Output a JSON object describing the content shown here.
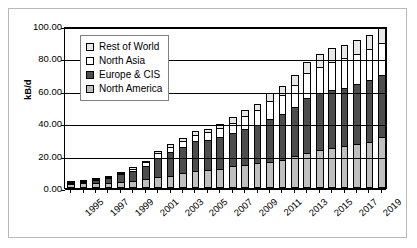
{
  "chart_data": {
    "type": "bar",
    "subtype": "stacked-column",
    "title": "",
    "xlabel": "",
    "ylabel": "kB/d",
    "ylim": [
      0,
      100
    ],
    "yticks": [
      "0.00",
      "20.00",
      "40.00",
      "60.00",
      "80.00",
      "100.00"
    ],
    "ytick_values": [
      0,
      20,
      40,
      60,
      80,
      100
    ],
    "grid": true,
    "legend_position": "upper-left-inside",
    "categories": [
      "1995",
      "1996",
      "1997",
      "1998",
      "1999",
      "2000",
      "2001",
      "2002",
      "2003",
      "2004",
      "2005",
      "2006",
      "2007",
      "2008",
      "2009",
      "2010",
      "2011",
      "2012",
      "2013",
      "2014",
      "2015",
      "2016",
      "2017",
      "2018",
      "2019",
      "2020"
    ],
    "xtick_labels": [
      "1995",
      "",
      "1997",
      "",
      "1999",
      "",
      "2001",
      "",
      "2003",
      "",
      "2005",
      "",
      "2007",
      "",
      "2009",
      "",
      "2011",
      "",
      "2013",
      "",
      "2015",
      "",
      "2017",
      "",
      "2019",
      ""
    ],
    "series": [
      {
        "name": "North America",
        "color": "#bfbfbf",
        "values": [
          2.6,
          2.8,
          3.0,
          3.4,
          3.8,
          4.4,
          5.4,
          6.5,
          7.6,
          9.2,
          10.4,
          11.4,
          12.0,
          13.4,
          14.4,
          15.2,
          16.2,
          17.2,
          20.0,
          21.8,
          23.2,
          24.6,
          26.0,
          27.4,
          28.4,
          31.4
        ]
      },
      {
        "name": "Europe & CIS",
        "color": "#4d4d4d",
        "values": [
          0.8,
          1.2,
          2.0,
          3.0,
          4.6,
          6.2,
          8.2,
          12.2,
          14.8,
          16.0,
          18.4,
          18.0,
          19.4,
          20.4,
          22.2,
          23.6,
          26.6,
          28.4,
          29.8,
          33.8,
          35.4,
          35.8,
          35.8,
          36.8,
          38.2,
          38.6
        ]
      },
      {
        "name": "North Asia",
        "color": "#ffffff",
        "values": [
          0.1,
          0.2,
          0.3,
          0.5,
          0.8,
          1.4,
          2.4,
          2.8,
          3.2,
          3.8,
          4.2,
          5.0,
          5.4,
          6.6,
          7.8,
          9.2,
          10.8,
          12.0,
          13.6,
          15.2,
          16.4,
          17.6,
          18.2,
          18.6,
          19.0,
          19.6
        ]
      },
      {
        "name": "Rest of World",
        "color": "#e8e8e8",
        "values": [
          0.1,
          0.2,
          0.3,
          0.4,
          0.6,
          0.8,
          1.0,
          1.2,
          1.4,
          1.6,
          2.0,
          2.2,
          2.6,
          3.2,
          3.6,
          4.0,
          4.8,
          5.4,
          6.4,
          7.2,
          8.0,
          8.4,
          8.6,
          8.8,
          9.0,
          9.4
        ]
      }
    ],
    "totals": [
      3.6,
      4.4,
      5.6,
      7.3,
      9.8,
      12.8,
      17.0,
      22.7,
      27.0,
      30.6,
      35.0,
      36.6,
      39.4,
      43.6,
      48.0,
      52.0,
      58.4,
      63.0,
      69.8,
      78.0,
      83.0,
      86.4,
      88.6,
      91.6,
      94.6,
      99.0
    ]
  },
  "legend": {
    "items": [
      {
        "label": "Rest of World",
        "swatch": "#e8e8e8"
      },
      {
        "label": "North Asia",
        "swatch": "#ffffff"
      },
      {
        "label": "Europe & CIS",
        "swatch": "#4d4d4d"
      },
      {
        "label": "North America",
        "swatch": "#bfbfbf"
      }
    ]
  },
  "axis": {
    "y_title": "kB/d"
  }
}
